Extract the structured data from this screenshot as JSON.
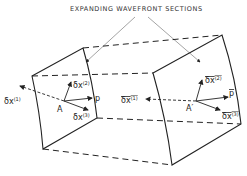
{
  "title": "EXPANDING WAVEFRONT SECTIONS",
  "left_section": {
    "point": "A",
    "vectors": [
      "δx⁽¹⁾",
      "δx⁽²⁾",
      "δx⁽³⁾",
      "p"
    ]
  },
  "right_section": {
    "point": "A'",
    "vectors": [
      "δx⁽¹⁾",
      "δx⁽²⁾",
      "δx⁽³⁾",
      "p"
    ],
    "overlined": true
  },
  "colors": {
    "line": "#222222",
    "background": "#ffffff"
  }
}
